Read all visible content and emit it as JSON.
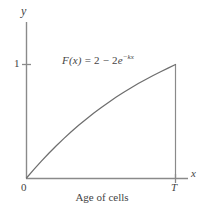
{
  "figure": {
    "caption": "Age of cells",
    "formula": {
      "lhs": "F(x)",
      "equals": " = ",
      "rhs_lead": "2 ",
      "minus": "−",
      "rhs_coefficient": " 2",
      "base": "e",
      "exponent": "−kx",
      "full": "F(x) = 2 − 2e^(−kx)"
    },
    "axes": {
      "y_label": "y",
      "x_label": "x",
      "origin_label": "0",
      "y_tick_label": "1",
      "x_tick_label": "T"
    },
    "colors": {
      "background": "#ffffff",
      "axis": "#8a8a8a",
      "curve": "#6e6e6e",
      "text": "#444444"
    }
  },
  "chart_data": {
    "type": "line",
    "title": "",
    "subtitle": "",
    "xlabel": "Age of cells",
    "ylabel": "y",
    "axis_label_x": "x",
    "axis_label_y": "y",
    "xticks": [
      0,
      1
    ],
    "xticklabels": [
      "0",
      "T"
    ],
    "yticks": [
      0,
      1
    ],
    "yticklabels": [
      "0",
      "1"
    ],
    "xlim": [
      0,
      1.08
    ],
    "ylim": [
      0,
      1.35
    ],
    "grid": false,
    "legend": null,
    "annotations": [
      {
        "text": "F(x) = 2 − 2e^(−kx)",
        "x": 0.36,
        "y": 1.15
      }
    ],
    "series": [
      {
        "name": "F(x) = 2 - 2e^(-kx)",
        "x": [
          0.0,
          0.05,
          0.1,
          0.15,
          0.2,
          0.25,
          0.3,
          0.35,
          0.4,
          0.45,
          0.5,
          0.55,
          0.6,
          0.65,
          0.7,
          0.75,
          0.8,
          0.85,
          0.9,
          0.95,
          1.0
        ],
        "y": [
          0.0,
          0.076,
          0.149,
          0.218,
          0.284,
          0.347,
          0.407,
          0.464,
          0.518,
          0.57,
          0.619,
          0.666,
          0.711,
          0.753,
          0.793,
          0.832,
          0.868,
          0.903,
          0.936,
          0.968,
          1.0
        ]
      },
      {
        "name": "vertical drop at T",
        "x": [
          1.0,
          1.0
        ],
        "y": [
          0.0,
          1.0
        ]
      }
    ]
  }
}
